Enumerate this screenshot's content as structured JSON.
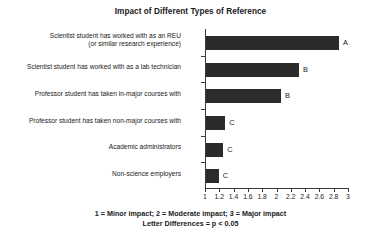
{
  "chart_data": {
    "type": "bar",
    "orientation": "horizontal",
    "title": "Impact of Different Types of Reference",
    "xlabel": "",
    "ylabel": "",
    "xlim": [
      1,
      3
    ],
    "grid": false,
    "legend": null,
    "xticks": [
      "1",
      "1.2",
      "1.4",
      "1.6",
      "1.8",
      "2",
      "2.2",
      "2.4",
      "2.6",
      "2.8",
      "3"
    ],
    "xtick_values": [
      1,
      1.2,
      1.4,
      1.6,
      1.8,
      2,
      2.2,
      2.4,
      2.6,
      2.8,
      3
    ],
    "categories": [
      "Scientist student has worked with as an REU\n(or similar research experience)",
      "Scientist student has worked with as a lab technician",
      "Professor student has taken in-major courses with",
      "Professor student has taken non-major courses with",
      "Academic administrators",
      "Non-science employers"
    ],
    "values": [
      2.86,
      2.3,
      2.05,
      1.27,
      1.24,
      1.18
    ],
    "annotations": [
      "A",
      "B",
      "B",
      "C",
      "C",
      "C"
    ],
    "bar_color": "#2b2b2b",
    "footnotes": [
      "1 = Minor impact; 2 = Moderate impact; 3 = Major impact",
      "Letter Differences = p < 0.05"
    ]
  }
}
